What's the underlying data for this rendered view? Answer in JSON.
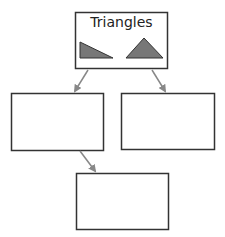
{
  "diagram": {
    "top_box": {
      "title": "Triangles",
      "shapes": [
        "right-triangle",
        "isosceles-triangle"
      ]
    },
    "left_box": {
      "text": ""
    },
    "right_box": {
      "text": ""
    },
    "bottom_box": {
      "text": ""
    },
    "colors": {
      "border": "#333333",
      "triangle_fill": "#777777",
      "arrow": "#888888"
    }
  }
}
